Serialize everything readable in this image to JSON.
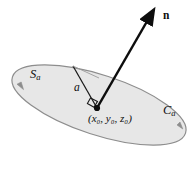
{
  "figure": {
    "background_color": "#ffffff",
    "stroke_color": "#0d0d0d",
    "disk_fill_color": "#e7e7e7",
    "disk_edge_color": "#8d8d8d"
  },
  "labels": {
    "surface": "S",
    "surface_sub": "a",
    "curve": "C",
    "curve_sub": "a",
    "radius": "a",
    "normal": "n",
    "center_point": "(x₀, y₀, z₀)",
    "center_point_plain": "(x0, y0, z0)"
  },
  "geometry": {
    "disk_center_x": 99,
    "disk_center_y": 105,
    "disk_semi_major": 91,
    "disk_semi_minor": 30,
    "disk_rotation_deg": 18,
    "center_dot_x": 97,
    "center_dot_y": 108,
    "normal_tip_x": 149,
    "normal_tip_y": 17,
    "radius_edge_x": 73,
    "radius_edge_y": 66
  },
  "annotations": {
    "right_angle_marker": "right-angle",
    "boundary_direction_arrows": 2
  }
}
